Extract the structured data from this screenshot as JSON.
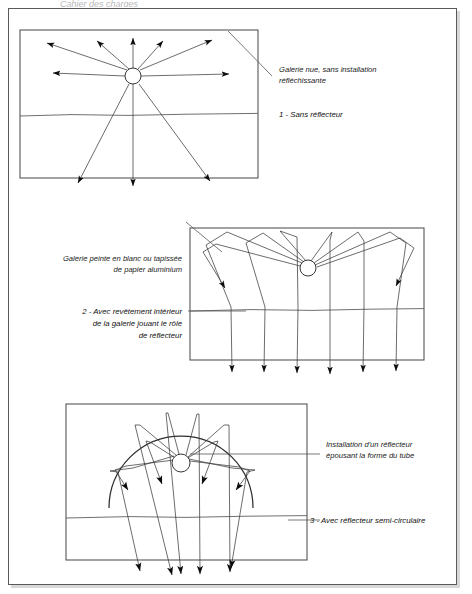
{
  "page": {
    "header_fragment": "Cahier des charges",
    "background": "#ffffff",
    "border_color": "#5a5a5a",
    "width": 472,
    "height": 594
  },
  "figures": [
    {
      "id": "fig-1",
      "number": "1",
      "annotation": {
        "line1": "Galerie nue, sans installation",
        "line2": "réfléchissante"
      },
      "caption": "1 - Sans réflecteur",
      "description": "Bare gallery, no reflective installation",
      "frame": {
        "x": 20,
        "y": 30,
        "w": 238,
        "h": 148
      },
      "source": {
        "cx": 133,
        "cy": 76,
        "r": 8
      },
      "ground_y": 115,
      "reflector": "none",
      "ray_count": 11
    },
    {
      "id": "fig-2",
      "number": "2",
      "annotation": {
        "line1": "Galerie peinte en blanc ou tapissée",
        "line2": "de papier aluminium"
      },
      "caption_lines": [
        "2 - Avec revêtement intérieur",
        "de la galerie jouant le rôle",
        "de réflecteur"
      ],
      "description": "Gallery painted white or lined with aluminium paper",
      "frame": {
        "x": 190,
        "y": 228,
        "w": 234,
        "h": 132
      },
      "source": {
        "cx": 308,
        "cy": 268,
        "r": 8
      },
      "ground_y": 310,
      "reflector": "ceiling-and-walls",
      "ray_count": 9
    },
    {
      "id": "fig-3",
      "number": "3",
      "annotation": {
        "line1": "Installation d'un réflecteur",
        "line2": "épousant la forme du tube"
      },
      "caption": "3 - Avec réflecteur semi-circulaire",
      "description": "Semi-circular reflector hugging the tube shape",
      "frame": {
        "x": 66,
        "y": 404,
        "w": 241,
        "h": 156
      },
      "source": {
        "cx": 181,
        "cy": 463,
        "r": 9
      },
      "ground_y": 517,
      "reflector": "semi-circular-arc",
      "arc_radius": 58,
      "ray_count": 9
    }
  ],
  "colors": {
    "ink": "#1a1a1a",
    "frame": "#4f4f4f",
    "ray": "#3b3b3b",
    "ground": "#5f5f5f",
    "reflector": "#2e2e2e",
    "paper": "#ffffff"
  }
}
